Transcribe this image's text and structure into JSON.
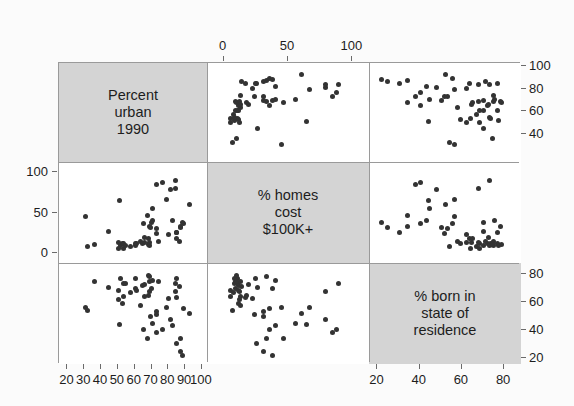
{
  "figure": {
    "type": "scatterplot-matrix",
    "title": "",
    "background_color": "#fbfbfb",
    "panel_background_color": "#ffffff",
    "diagonal_background_color": "#d4d4d4",
    "point_color": "#333333",
    "frame_color": "#9a9a9a"
  },
  "variables": [
    {
      "key": "urban",
      "label_lines": [
        "Percent",
        "urban",
        "1990"
      ],
      "axis_min": 15,
      "axis_max": 103
    },
    {
      "key": "homes",
      "label_lines": [
        "% homes",
        "cost",
        "$100K+"
      ],
      "axis_min": -13,
      "axis_max": 113
    },
    {
      "key": "born",
      "label_lines": [
        "% born in",
        "state of",
        "residence"
      ],
      "axis_min": 16,
      "axis_max": 88
    }
  ],
  "axes": {
    "top": {
      "variable": "homes",
      "ticks": [
        0,
        50,
        100
      ],
      "labels": [
        "0",
        "50",
        "100"
      ]
    },
    "right_top": {
      "variable": "urban",
      "ticks": [
        40,
        60,
        80,
        100
      ],
      "labels": [
        "40",
        "60",
        "80",
        "100"
      ]
    },
    "right_bottom": {
      "variable": "born",
      "ticks": [
        20,
        40,
        60,
        80
      ],
      "labels": [
        "20",
        "40",
        "60",
        "80"
      ]
    },
    "left_middle": {
      "variable": "homes",
      "ticks": [
        0,
        50,
        100
      ],
      "labels": [
        "0",
        "50",
        "100"
      ]
    },
    "bottom_left": {
      "variable": "urban",
      "ticks": [
        20,
        30,
        40,
        50,
        60,
        70,
        80,
        90,
        100
      ],
      "labels": [
        "20",
        "30",
        "40",
        "50",
        "60",
        "70",
        "80",
        "90",
        "100"
      ]
    },
    "bottom_right": {
      "variable": "born",
      "ticks": [
        20,
        40,
        60,
        80
      ],
      "labels": [
        "20",
        "40",
        "60",
        "80"
      ]
    }
  },
  "chart_data": {
    "type": "scatter",
    "title": "",
    "subtitle": "",
    "xlabel": "",
    "ylabel": "",
    "layout": "3x3 scatterplot matrix, diagonal shows variable names on gray background",
    "grid": false,
    "legend": "none",
    "variables": [
      {
        "name": "Percent urban 1990",
        "short": "urban",
        "range": [
          15,
          103
        ],
        "tick_labels": [
          "20",
          "30",
          "40",
          "50",
          "60",
          "70",
          "80",
          "90",
          "100"
        ]
      },
      {
        "name": "% homes cost $100K+",
        "short": "homes",
        "range": [
          -13,
          113
        ],
        "tick_labels": [
          "0",
          "50",
          "100"
        ]
      },
      {
        "name": "% born in state of residence",
        "short": "born",
        "range": [
          16,
          88
        ],
        "tick_labels": [
          "20",
          "40",
          "60",
          "80"
        ]
      }
    ],
    "n_points": 51,
    "points": [
      {
        "urban": 60.4,
        "homes": 9.1,
        "born": 70.1
      },
      {
        "urban": 67.5,
        "homes": 46.5,
        "born": 34.0
      },
      {
        "urban": 87.5,
        "homes": 32.9,
        "born": 34.2
      },
      {
        "urban": 53.5,
        "homes": 4.9,
        "born": 64.1
      },
      {
        "urban": 92.6,
        "homes": 60.6,
        "born": 52.0
      },
      {
        "urban": 82.4,
        "homes": 40.6,
        "born": 43.3
      },
      {
        "urban": 79.1,
        "homes": 66.4,
        "born": 56.4
      },
      {
        "urban": 73.0,
        "homes": 30.6,
        "born": 53.1
      },
      {
        "urban": 84.8,
        "homes": 25.3,
        "born": 30.5
      },
      {
        "urban": 84.8,
        "homes": 17.2,
        "born": 63.7
      },
      {
        "urban": 63.2,
        "homes": 13.4,
        "born": 57.8
      },
      {
        "urban": 89.3,
        "homes": 35.8,
        "born": 55.6
      },
      {
        "urban": 57.4,
        "homes": 7.5,
        "born": 66.7
      },
      {
        "urban": 84.6,
        "homes": 24.9,
        "born": 77.0
      },
      {
        "urban": 64.9,
        "homes": 11.4,
        "born": 72.0
      },
      {
        "urban": 60.6,
        "homes": 10.9,
        "born": 77.1
      },
      {
        "urban": 68.9,
        "homes": 9.0,
        "born": 74.9
      },
      {
        "urban": 51.8,
        "homes": 8.3,
        "born": 77.2
      },
      {
        "urban": 68.1,
        "homes": 10.0,
        "born": 78.9
      },
      {
        "urban": 44.6,
        "homes": 25.9,
        "born": 70.4
      },
      {
        "urban": 81.3,
        "homes": 79.1,
        "born": 48.0
      },
      {
        "urban": 84.3,
        "homes": 79.5,
        "born": 68.0
      },
      {
        "urban": 70.5,
        "homes": 40.0,
        "born": 75.4
      },
      {
        "urban": 69.9,
        "homes": 37.6,
        "born": 70.0
      },
      {
        "urban": 30.5,
        "homes": 45.0,
        "born": 56.4
      },
      {
        "urban": 68.7,
        "homes": 12.6,
        "born": 67.9
      },
      {
        "urban": 52.5,
        "homes": 11.5,
        "born": 59.4
      },
      {
        "urban": 66.1,
        "homes": 12.7,
        "born": 64.4
      },
      {
        "urban": 88.3,
        "homes": 37.8,
        "born": 21.8
      },
      {
        "urban": 51.0,
        "homes": 64.5,
        "born": 44.0
      },
      {
        "urban": 72.9,
        "homes": 84.8,
        "born": 38.1
      },
      {
        "urban": 73.0,
        "homes": 24.0,
        "born": 51.6
      },
      {
        "urban": 84.3,
        "homes": 89.6,
        "born": 73.1
      },
      {
        "urban": 50.4,
        "homes": 12.1,
        "born": 62.0
      },
      {
        "urban": 53.3,
        "homes": 10.8,
        "born": 73.6
      },
      {
        "urban": 74.1,
        "homes": 13.2,
        "born": 74.8
      },
      {
        "urban": 68.0,
        "homes": 17.8,
        "born": 64.9
      },
      {
        "urban": 70.5,
        "homes": 55.6,
        "born": 44.6
      },
      {
        "urban": 68.9,
        "homes": 33.0,
        "born": 78.4
      },
      {
        "urban": 86.5,
        "homes": 14.1,
        "born": 71.2
      },
      {
        "urban": 54.6,
        "homes": 8.3,
        "born": 73.3
      },
      {
        "urban": 50.2,
        "homes": 5.5,
        "born": 68.4
      },
      {
        "urban": 60.9,
        "homes": 11.7,
        "born": 68.5
      },
      {
        "urban": 80.3,
        "homes": 22.4,
        "born": 62.4
      },
      {
        "urban": 87.0,
        "homes": 31.1,
        "born": 24.6
      },
      {
        "urban": 32.2,
        "homes": 7.2,
        "born": 54.3
      },
      {
        "urban": 69.4,
        "homes": 31.0,
        "born": 50.2
      },
      {
        "urban": 76.4,
        "homes": 87.7,
        "born": 40.3
      },
      {
        "urban": 36.1,
        "homes": 10.1,
        "born": 74.6
      },
      {
        "urban": 65.7,
        "homes": 19.2,
        "born": 72.7
      },
      {
        "urban": 65.0,
        "homes": 35.8,
        "born": 40.6
      }
    ],
    "panels": [
      {
        "row": 0,
        "col": 0,
        "kind": "diagonal",
        "text": "Percent urban 1990"
      },
      {
        "row": 0,
        "col": 1,
        "kind": "scatter",
        "x": "homes",
        "y": "urban"
      },
      {
        "row": 0,
        "col": 2,
        "kind": "scatter",
        "x": "born",
        "y": "urban"
      },
      {
        "row": 1,
        "col": 0,
        "kind": "scatter",
        "x": "urban",
        "y": "homes"
      },
      {
        "row": 1,
        "col": 1,
        "kind": "diagonal",
        "text": "% homes cost $100K+"
      },
      {
        "row": 1,
        "col": 2,
        "kind": "scatter",
        "x": "born",
        "y": "homes"
      },
      {
        "row": 2,
        "col": 0,
        "kind": "scatter",
        "x": "urban",
        "y": "born"
      },
      {
        "row": 2,
        "col": 1,
        "kind": "scatter",
        "x": "homes",
        "y": "born"
      },
      {
        "row": 2,
        "col": 2,
        "kind": "diagonal",
        "text": "% born in state of residence"
      }
    ]
  }
}
